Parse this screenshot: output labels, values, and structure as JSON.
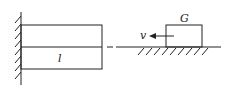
{
  "diagram": {
    "beam_label": "l",
    "block_label": "G",
    "velocity_label": "v",
    "colors": {
      "stroke": "#222222",
      "background": "#ffffff"
    }
  }
}
